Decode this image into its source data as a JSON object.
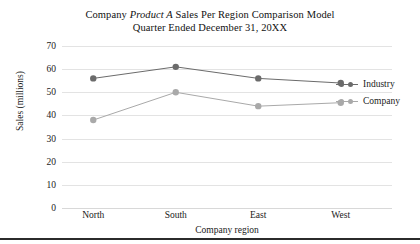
{
  "chart_data": {
    "type": "line",
    "title": "Company Product A Sales Per Region Comparison Model",
    "title_line1_prefix": "Company ",
    "title_line1_italic": "Product A",
    "title_line1_suffix": " Sales Per Region Comparison Model",
    "title_line2": "Quarter Ended December 31, 20XX",
    "subtitle": "Quarter Ended December 31, 20XX",
    "xlabel": "Company region",
    "ylabel": "Sales (millions)",
    "categories": [
      "North",
      "South",
      "East",
      "West"
    ],
    "ylim": [
      0,
      70
    ],
    "yticks": [
      70,
      60,
      50,
      40,
      30,
      20,
      10,
      0
    ],
    "grid": true,
    "legend_position": "right",
    "series": [
      {
        "name": "Industry",
        "values": [
          56,
          61,
          56,
          54
        ],
        "color": "#6b6b6b",
        "marker": "circle"
      },
      {
        "name": "Company",
        "values": [
          38,
          50,
          44,
          45.5
        ],
        "color": "#a9a9a9",
        "marker": "circle"
      }
    ]
  },
  "colors": {
    "industry": "#6b6b6b",
    "company": "#a9a9a9",
    "gridline": "#e3e3e3",
    "text": "#1a1a1a",
    "rule": "#2b2b2b",
    "background": "#ffffff"
  }
}
